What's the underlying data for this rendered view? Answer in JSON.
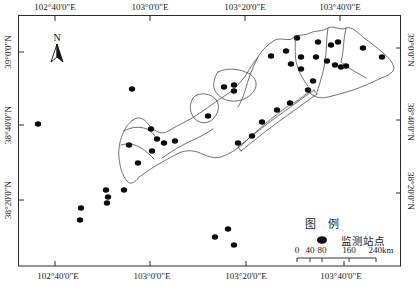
{
  "map": {
    "north_label": "N",
    "top_axis": [
      "102°40'0\"E",
      "103°0'0\"E",
      "103°20'0\"E",
      "103°40'0\"E"
    ],
    "bottom_axis": [
      "102°40'0\"E",
      "103°0'0\"E",
      "103°20'0\"E",
      "103°40'0\"E"
    ],
    "left_axis": [
      "39°0'0\"N",
      "38°40'0\"N",
      "38°20'0\"N"
    ],
    "right_axis": [
      "39°0'0\"N",
      "38°40'0\"N",
      "38°20'0\"N"
    ],
    "colors": {
      "station": "#0c0c0c",
      "boundary": "#4d4d4d",
      "frame": "#2b2b2b"
    },
    "stations": [
      [
        297,
        38
      ],
      [
        318,
        42
      ],
      [
        331,
        45
      ],
      [
        338,
        42
      ],
      [
        363,
        48
      ],
      [
        382,
        57
      ],
      [
        271,
        56
      ],
      [
        286,
        51
      ],
      [
        301,
        57
      ],
      [
        316,
        57
      ],
      [
        291,
        64
      ],
      [
        327,
        61
      ],
      [
        335,
        65
      ],
      [
        341,
        67
      ],
      [
        346,
        66
      ],
      [
        301,
        69
      ],
      [
        313,
        81
      ],
      [
        308,
        90
      ],
      [
        290,
        103
      ],
      [
        277,
        110
      ],
      [
        262,
        122
      ],
      [
        252,
        136
      ],
      [
        238,
        143
      ],
      [
        224,
        87
      ],
      [
        234,
        85
      ],
      [
        234,
        91
      ],
      [
        208,
        116
      ],
      [
        132,
        89
      ],
      [
        38,
        124
      ],
      [
        129,
        145
      ],
      [
        151,
        129
      ],
      [
        157,
        139
      ],
      [
        164,
        143
      ],
      [
        175,
        141
      ],
      [
        152,
        151
      ],
      [
        138,
        163
      ],
      [
        106,
        190
      ],
      [
        124,
        190
      ],
      [
        108,
        197
      ],
      [
        107,
        203
      ],
      [
        81,
        208
      ],
      [
        80,
        220
      ],
      [
        228,
        229
      ],
      [
        215,
        237
      ],
      [
        234,
        245
      ]
    ],
    "boundaries": {
      "outer": "M 133,120 C 138,116 144,118 148,124 L 152,128 C 158,133 163,135 170,130 C 180,124 190,120 200,113 C 210,106 218,100 226,95 C 234,90 240,83 246,75 C 250,68 254,62 258,57 C 262,50 268,44 275,40 C 282,37 288,42 293,38 C 298,34 304,36 310,33 C 316,30 322,32 328,28 C 334,25 340,31 346,28 C 352,26 358,33 364,38 C 370,42 376,47 382,52 C 388,57 393,62 394,68 C 393,74 386,76 379,79 C 371,83 362,87 353,90 C 344,93 336,95 328,97 C 320,99 314,97 309,92 C 302,97 295,103 288,106 C 280,112 272,118 265,124 C 257,131 250,137 243,144 C 236,150 229,154 221,157 C 214,159 207,156 200,153 C 193,150 186,150 179,153 C 171,157 164,161 157,165 C 150,169 144,174 139,177 C 135,183 130,185 127,181 C 122,175 120,167 119,158 C 118,149 120,139 124,131 C 127,125 130,122 133,120 Z",
      "inner": [
        "M 258,57 C 252,68 248,80 245,91 C 243,97 241,102 238,107",
        "M 295,36 C 296,46 294,56 297,65 C 299,73 303,79 308,86",
        "M 328,28 C 326,39 327,50 325,61 C 324,70 321,80 317,92",
        "M 346,28 C 343,40 344,51 341,62 C 349,69 358,73 366,78",
        "M 218,72 C 228,67 240,69 250,74 C 256,78 258,85 254,91 C 249,98 240,102 231,101 C 223,100 216,95 214,88 C 213,82 215,76 218,72 Z",
        "M 197,95 C 205,92 213,95 217,101 C 220,107 218,114 213,119 C 208,124 200,124 195,119 C 190,114 189,106 192,100 C 193,97 195,96 197,95 Z",
        "M 124,131 C 131,127 139,126 147,129 C 151,131 154,134 156,138",
        "M 121,145 C 128,143 135,144 141,148 C 146,151 150,155 154,159",
        "M 162,158 C 172,151 182,145 193,140 C 200,137 207,133 213,129"
      ],
      "strip": [
        "M 314,90 C 300,100 285,111 271,121 C 259,130 248,139 238,147",
        "M 317,94 C 303,104 288,115 274,125 C 262,134 251,143 241,151",
        "M 314,90 L 317,94",
        "M 238,147 L 241,151"
      ]
    }
  },
  "legend": {
    "title": "图 例",
    "station_label": "监测站点"
  },
  "scalebar": {
    "labels": [
      "0",
      "40",
      "80",
      "160",
      "240km"
    ]
  }
}
